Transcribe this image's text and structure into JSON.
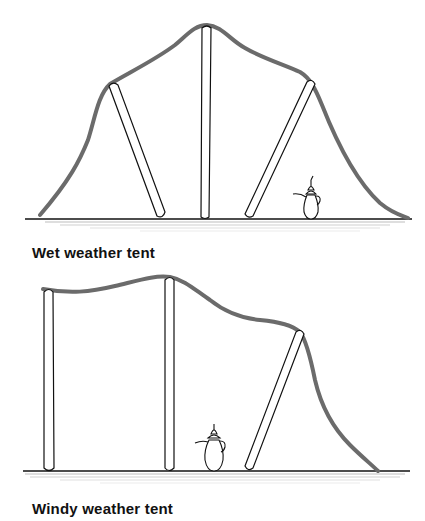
{
  "figure": {
    "panels": [
      {
        "id": "wet",
        "caption": "Wet weather tent",
        "elements": [
          "tent-cloth",
          "center-pole",
          "left-slanted-pole",
          "right-slanted-pole",
          "coffee-pot",
          "ground"
        ]
      },
      {
        "id": "windy",
        "caption": "Windy weather tent",
        "elements": [
          "tent-cloth",
          "left-pole",
          "middle-pole",
          "right-slanted-pole",
          "coffee-pot",
          "ground"
        ]
      }
    ],
    "colors": {
      "cloth": "#6b6b6b",
      "line": "#111111",
      "ground_speckle": "#555555",
      "background": "#ffffff"
    }
  }
}
